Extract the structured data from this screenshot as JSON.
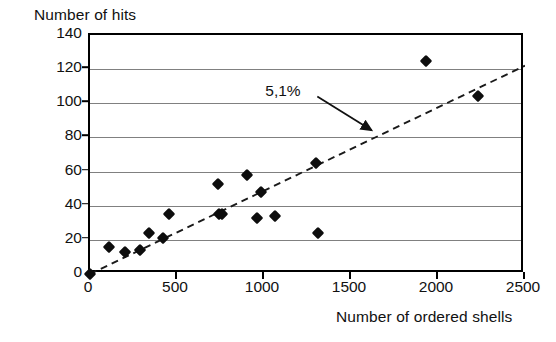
{
  "chart_data": {
    "type": "scatter",
    "title": "",
    "xlabel": "Number of ordered shells",
    "ylabel": "Number of hits",
    "xlim": [
      0,
      2500
    ],
    "ylim": [
      0,
      140
    ],
    "xticks": [
      0,
      500,
      1000,
      1500,
      2000,
      2500
    ],
    "yticks": [
      0,
      20,
      40,
      60,
      80,
      100,
      120,
      140
    ],
    "grid": "horizontal",
    "legend": "none",
    "series": [
      {
        "name": "observations",
        "marker": "diamond",
        "color": "#0d0d0d",
        "points": [
          {
            "x": 0,
            "y": 0
          },
          {
            "x": 110,
            "y": 16
          },
          {
            "x": 200,
            "y": 13
          },
          {
            "x": 290,
            "y": 14
          },
          {
            "x": 340,
            "y": 24
          },
          {
            "x": 420,
            "y": 21
          },
          {
            "x": 455,
            "y": 35
          },
          {
            "x": 735,
            "y": 53
          },
          {
            "x": 740,
            "y": 35
          },
          {
            "x": 760,
            "y": 35
          },
          {
            "x": 900,
            "y": 58
          },
          {
            "x": 960,
            "y": 33
          },
          {
            "x": 980,
            "y": 48
          },
          {
            "x": 1065,
            "y": 34
          },
          {
            "x": 1300,
            "y": 65
          },
          {
            "x": 1310,
            "y": 24
          },
          {
            "x": 1930,
            "y": 125
          },
          {
            "x": 2230,
            "y": 104
          }
        ]
      }
    ],
    "trendline": {
      "style": "dashed",
      "color": "#1a1a1a",
      "slope_percent": "5,1%",
      "slope": 0.051,
      "intercept": 0,
      "x_start": 0,
      "y_start": 0,
      "x_end": 2500,
      "y_end": 122
    },
    "annotations": [
      {
        "text": "5,1%",
        "target_x": 1630,
        "target_y": 83,
        "label_x": 1180,
        "label_y": 104
      }
    ]
  },
  "axes": {
    "y_title": "Number of hits",
    "x_title": "Number of ordered shells",
    "y_tick_labels": [
      "140",
      "120",
      "100",
      "80",
      "60",
      "40",
      "20",
      "0"
    ],
    "x_tick_labels": [
      "0",
      "500",
      "1000",
      "1500",
      "2000",
      "2500"
    ]
  },
  "colors": {
    "marker": "#0d0d0d",
    "grid": "#808080",
    "frame": "#000000",
    "text": "#111111"
  }
}
